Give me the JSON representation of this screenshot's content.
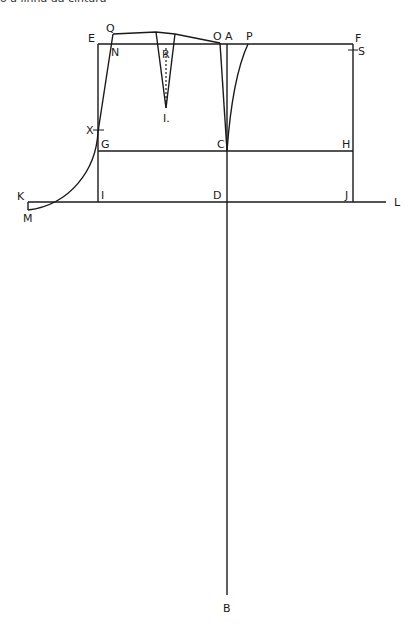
{
  "caption": "o a linha da cintura",
  "diagram": {
    "type": "sewing-pattern-draft",
    "labels": {
      "E": "E",
      "Q": "Q",
      "N": "N",
      "R": "R",
      "I1": "I.",
      "O": "O",
      "A": "A",
      "P": "P",
      "F": "F",
      "S": "S",
      "X": "X",
      "G": "G",
      "C": "C",
      "H": "H",
      "K": "K",
      "M": "M",
      "I": "I",
      "D": "D",
      "J": "J",
      "L": "L",
      "B": "B"
    }
  }
}
